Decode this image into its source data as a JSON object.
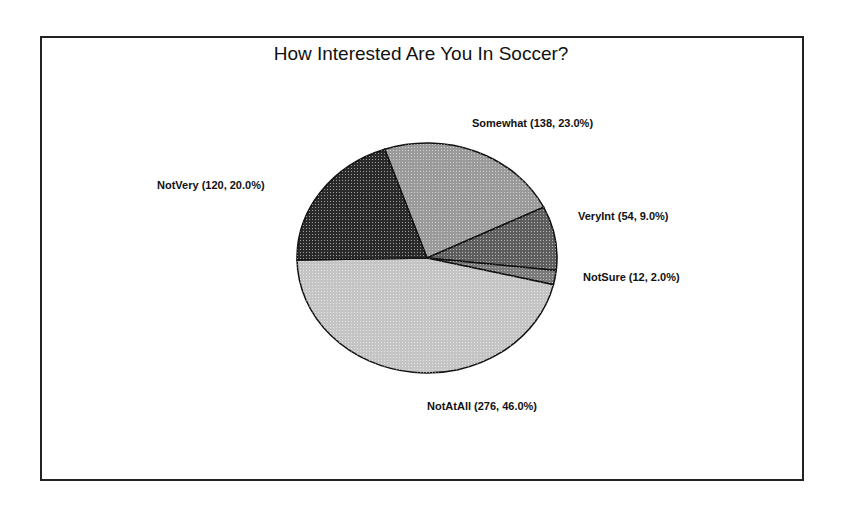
{
  "chart_data": {
    "type": "pie",
    "title": "How Interested Are You In Soccer?",
    "total": 600,
    "slices": [
      {
        "name": "Somewhat",
        "value": 138,
        "percent": 23.0,
        "label": "Somewhat (138, 23.0%)",
        "fill": "#9a9a9a"
      },
      {
        "name": "VeryInt",
        "value": 54,
        "percent": 9.0,
        "label": "VeryInt  (54,  9.0%)",
        "fill": "#5e5e5e"
      },
      {
        "name": "NotSure",
        "value": 12,
        "percent": 2.0,
        "label": "NotSure  (12,  2.0%)",
        "fill": "#7a7a7a"
      },
      {
        "name": "NotAtAll",
        "value": 276,
        "percent": 46.0,
        "label": "NotAtAll (276, 46.0%)",
        "fill": "#c4c4c4"
      },
      {
        "name": "NotVery",
        "value": 120,
        "percent": 20.0,
        "label": "NotVery (120, 20.0%)",
        "fill": "#2a2a2a"
      }
    ],
    "legend": "none (inline labels)"
  }
}
